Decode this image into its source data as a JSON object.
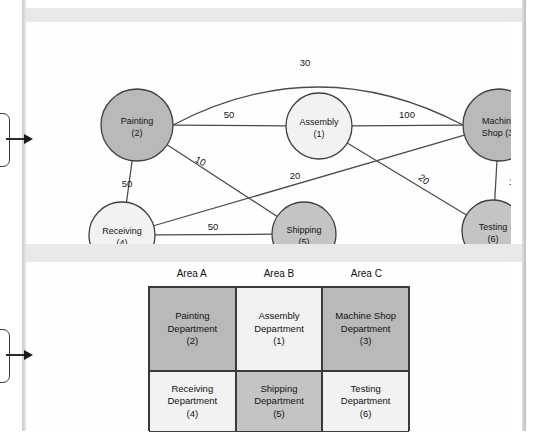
{
  "chart_data": {
    "type": "diagram",
    "title": "",
    "subtitle": "",
    "diagrams": [
      {
        "name": "from-to-flow-graph",
        "kind": "node-link-graph",
        "nodes": [
          {
            "id": 2,
            "label_line1": "Painting",
            "label_line2": "(2)",
            "shade": "dark",
            "x": 104,
            "y": 103,
            "r": 36
          },
          {
            "id": 1,
            "label_line1": "Assembly",
            "label_line2": "(1)",
            "shade": "light",
            "x": 286,
            "y": 104,
            "r": 33
          },
          {
            "id": 3,
            "label_line1": "Machine",
            "label_line2": "Shop (3)",
            "shade": "dark",
            "x": 466,
            "y": 103,
            "r": 36
          },
          {
            "id": 4,
            "label_line1": "Receiving",
            "label_line2": "(4)",
            "shade": "light",
            "x": 89,
            "y": 213,
            "r": 33
          },
          {
            "id": 5,
            "label_line1": "Shipping",
            "label_line2": "(5)",
            "shade": "mid",
            "x": 271,
            "y": 212,
            "r": 32
          },
          {
            "id": 6,
            "label_line1": "Testing",
            "label_line2": "(6)",
            "shade": "mid",
            "x": 460,
            "y": 209,
            "r": 31
          }
        ],
        "edges": [
          {
            "from": 2,
            "to": 3,
            "weight": "30",
            "curved": true,
            "label_x": 272,
            "label_y": 44
          },
          {
            "from": 2,
            "to": 1,
            "weight": "50",
            "curved": false,
            "label_x": 196,
            "label_y": 96
          },
          {
            "from": 1,
            "to": 3,
            "weight": "100",
            "curved": false,
            "label_x": 374,
            "label_y": 96
          },
          {
            "from": 2,
            "to": 4,
            "weight": "50",
            "curved": false,
            "label_x": 94,
            "label_y": 165
          },
          {
            "from": 2,
            "to": 5,
            "weight": "10",
            "curved": false,
            "label_x": 166,
            "label_y": 142,
            "rotate": 27
          },
          {
            "from": 4,
            "to": 3,
            "weight": "20",
            "curved": false,
            "label_x": 262,
            "label_y": 157
          },
          {
            "from": 1,
            "to": 6,
            "weight": "20",
            "curved": false,
            "label_x": 389,
            "label_y": 160,
            "rotate": 37
          },
          {
            "from": 4,
            "to": 5,
            "weight": "50",
            "curved": false,
            "label_x": 180,
            "label_y": 208
          },
          {
            "from": 3,
            "to": 6,
            "weight": "100",
            "curved": false,
            "label_x": 484,
            "label_y": 163
          }
        ]
      },
      {
        "name": "department-layout-grid",
        "kind": "grid",
        "column_headers": [
          "Area A",
          "Area B",
          "Area C"
        ],
        "cells": [
          [
            {
              "name": "Painting",
              "suffix": "Department",
              "number": "(2)",
              "shade": "dark"
            },
            {
              "name": "Assembly",
              "suffix": "Department",
              "number": "(1)",
              "shade": "light"
            },
            {
              "name": "Machine Shop",
              "suffix": "Department",
              "number": "(3)",
              "shade": "dark"
            }
          ],
          [
            {
              "name": "Receiving",
              "suffix": "Department",
              "number": "(4)",
              "shade": "light"
            },
            {
              "name": "Shipping",
              "suffix": "Department",
              "number": "(5)",
              "shade": "mid"
            },
            {
              "name": "Testing",
              "suffix": "Department",
              "number": "(6)",
              "shade": "light"
            }
          ]
        ]
      }
    ],
    "colors": {
      "shade_dark": "#b9b9b9",
      "shade_mid": "#c4c4c4",
      "shade_light": "#f2f2f2",
      "stroke": "#3f3f3f",
      "text": "#141414",
      "frame": "#e9e9e9"
    }
  }
}
